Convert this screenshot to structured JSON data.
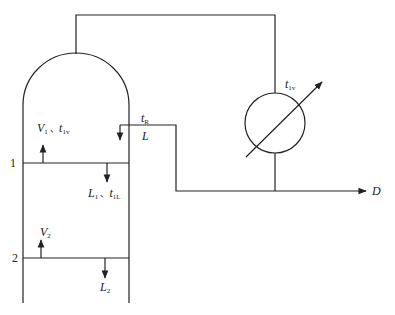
{
  "diagram": {
    "type": "distillation column with partial condenser schematic",
    "stroke_color": "#222222",
    "labels": {
      "condenser_temp": {
        "main": "t",
        "sub": "1v"
      },
      "reflux_temp": {
        "main": "t",
        "sub": "R"
      },
      "reflux_flow": {
        "main": "L"
      },
      "vapor_1": {
        "main": "V",
        "sub": "1",
        "sep": " 、",
        "main2": "t",
        "sub2": "1v"
      },
      "liquid_1": {
        "main": "L",
        "sub": "1",
        "sep": " 、",
        "main2": "t",
        "sub2": "1L"
      },
      "vapor_2": {
        "main": "V",
        "sub": "2"
      },
      "liquid_2": {
        "main": "L",
        "sub": "2"
      },
      "distillate": {
        "main": "D"
      },
      "tray_1": "1",
      "tray_2": "2"
    }
  }
}
